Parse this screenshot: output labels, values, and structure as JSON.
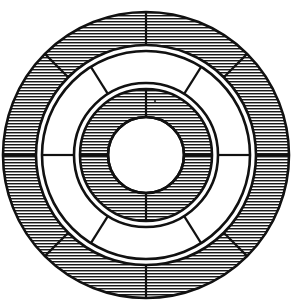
{
  "figure": {
    "name": "concentric-ring-diagram",
    "title": "Segmented concentric annulus diagram",
    "canvas": {
      "width": 291,
      "height": 303,
      "background_color": "#ffffff"
    },
    "center": {
      "cx": 146,
      "cy": 155
    },
    "stroke_color": "#111111",
    "hatch_color": "#1a1a1a",
    "fill_color": "#ffffff",
    "outer_stroke_width": 2.6,
    "divider_stroke_width": 2.2,
    "hatch_spacing": 3.0,
    "hatch_line_width": 1.4,
    "speck": {
      "cx": 155,
      "cy": 101,
      "r": 1.1,
      "color": "#222222"
    }
  },
  "rings": [
    {
      "id": "outer-ring",
      "label": "Outer ring",
      "shaded": true,
      "hatched": true,
      "outer_radius": 143,
      "inner_radius": 110,
      "segment_count": 8,
      "divider_angles_deg": [
        90,
        45,
        0,
        315,
        270,
        225,
        180,
        135
      ]
    },
    {
      "id": "middle-ring",
      "label": "Middle ring",
      "shaded": false,
      "hatched": false,
      "outer_radius": 104,
      "inner_radius": 72,
      "segment_count": 6,
      "divider_angles_deg": [
        58,
        0,
        302,
        238,
        180,
        122
      ]
    },
    {
      "id": "inner-ring",
      "label": "Inner ring",
      "shaded": true,
      "hatched": true,
      "outer_radius": 66,
      "inner_radius": 38,
      "segment_count": 4,
      "divider_angles_deg": [
        90,
        0,
        270,
        180
      ]
    },
    {
      "id": "core-disc",
      "label": "Center disc",
      "shaded": false,
      "hatched": false,
      "outer_radius": 38,
      "inner_radius": 0,
      "segment_count": 0,
      "divider_angles_deg": []
    }
  ]
}
